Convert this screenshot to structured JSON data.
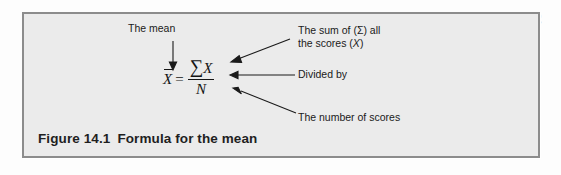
{
  "figure": {
    "caption_number": "Figure 14.1",
    "caption_title": "Formula for the mean",
    "bleed_text": "STOP & THINK",
    "border_color": "#8c8c8c",
    "panel_background": "#ebebeb",
    "text_color": "#1a1a1a"
  },
  "formula": {
    "mean_symbol": "X",
    "equals": "=",
    "numerator_sigma": "∑",
    "numerator_variable": "X",
    "denominator": "N",
    "expression": "X̄ = ∑X / N"
  },
  "annotations": [
    {
      "id": "the-mean",
      "text": "The mean",
      "points_to": "mean_symbol",
      "arrow": "down"
    },
    {
      "id": "the-sum",
      "line1_prefix": "The sum of (",
      "sigma": "Σ",
      "line1_suffix": ") all",
      "line2_prefix": "the scores (",
      "variable": "X",
      "line2_suffix": ")",
      "text": "The sum of (Σ) all the scores (X)",
      "points_to": "numerator",
      "arrow": "diagonal-down-left"
    },
    {
      "id": "divided-by",
      "text": "Divided by",
      "points_to": "fraction_bar",
      "arrow": "left"
    },
    {
      "id": "number-of-scores",
      "text": "The number of scores",
      "points_to": "denominator",
      "arrow": "diagonal-up-left"
    }
  ]
}
